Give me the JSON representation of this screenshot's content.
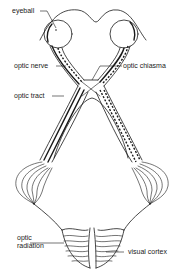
{
  "diagram": {
    "title": "",
    "labels": [
      {
        "id": "eyeball",
        "text": "eyeball"
      },
      {
        "id": "optic_nerve",
        "text": "optic nerve"
      },
      {
        "id": "optic_chiasma",
        "text": "optic chiasma"
      },
      {
        "id": "optic_tract",
        "text": "optic tract"
      },
      {
        "id": "optic_radiation_line1",
        "text": "optic"
      },
      {
        "id": "optic_radiation_line2",
        "text": "radiation"
      },
      {
        "id": "visual_cortex",
        "text": "visual cortex"
      }
    ],
    "colors": {
      "ink": "#1a1a1a",
      "background": "#ffffff"
    }
  }
}
